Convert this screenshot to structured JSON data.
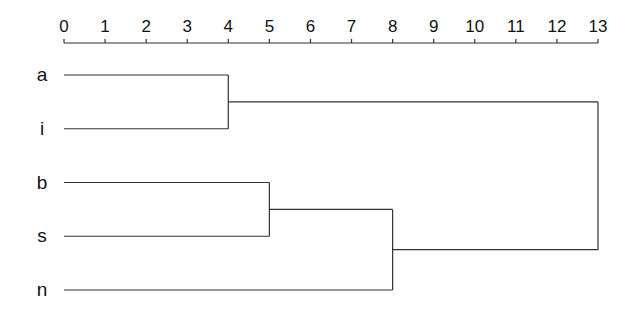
{
  "chart_data": {
    "type": "dendrogram",
    "title": "",
    "xlabel": "",
    "ylabel": "",
    "axis_position": "top",
    "xlim": [
      0,
      13
    ],
    "ticks": [
      0,
      1,
      2,
      3,
      4,
      5,
      6,
      7,
      8,
      9,
      10,
      11,
      12,
      13
    ],
    "grid": false,
    "leaves": [
      "a",
      "i",
      "b",
      "s",
      "n"
    ],
    "merges": [
      {
        "id": "c1",
        "children": [
          "a",
          "i"
        ],
        "height": 4
      },
      {
        "id": "c2",
        "children": [
          "b",
          "s"
        ],
        "height": 5
      },
      {
        "id": "c3",
        "children": [
          "c2",
          "n"
        ],
        "height": 8
      },
      {
        "id": "c4",
        "children": [
          "c1",
          "c3"
        ],
        "height": 13
      }
    ]
  },
  "colors": {
    "line": "#333333",
    "text": "#111111",
    "background": "#ffffff"
  }
}
